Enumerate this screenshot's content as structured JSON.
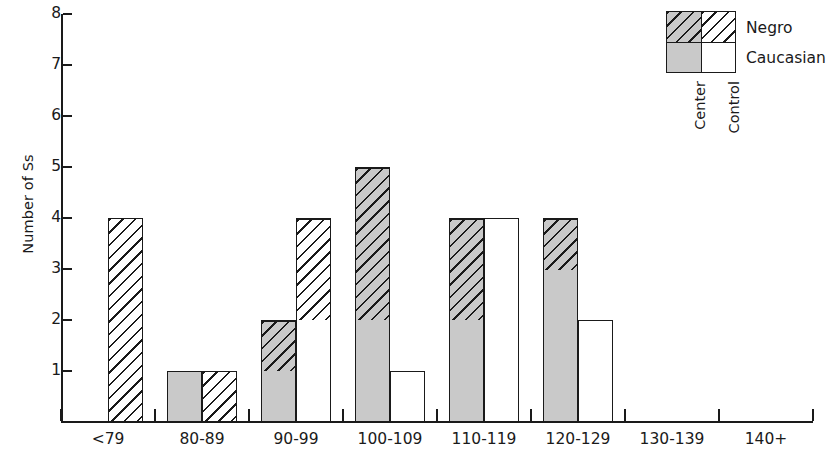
{
  "chart_data": {
    "type": "bar",
    "subtype": "stacked-grouped-histogram",
    "title": "",
    "xlabel": "",
    "ylabel": "Number of Ss",
    "ylim": [
      0,
      8
    ],
    "yticks": [
      1,
      2,
      3,
      4,
      5,
      6,
      7,
      8
    ],
    "grid": false,
    "categories": [
      "<79",
      "80-89",
      "90-99",
      "100-109",
      "110-119",
      "120-129",
      "130-139",
      "140+"
    ],
    "groups": [
      "Center",
      "Control"
    ],
    "stack_order": [
      "Caucasian",
      "Negro"
    ],
    "series": [
      {
        "name": "Center / Caucasian",
        "group": "Center",
        "race": "Caucasian",
        "values": [
          0,
          1,
          1,
          2,
          2,
          3,
          0,
          0
        ]
      },
      {
        "name": "Center / Negro",
        "group": "Center",
        "race": "Negro",
        "values": [
          0,
          0,
          1,
          3,
          2,
          1,
          0,
          0
        ]
      },
      {
        "name": "Control / Caucasian",
        "group": "Control",
        "race": "Caucasian",
        "values": [
          0,
          0,
          2,
          1,
          4,
          2,
          0,
          0
        ]
      },
      {
        "name": "Control / Negro",
        "group": "Control",
        "race": "Negro",
        "values": [
          4,
          1,
          2,
          0,
          0,
          0,
          0,
          0
        ]
      }
    ],
    "totals": {
      "Center": [
        0,
        1,
        2,
        5,
        4,
        4,
        0,
        0
      ],
      "Control": [
        4,
        1,
        4,
        1,
        4,
        2,
        0,
        0
      ]
    },
    "legend": {
      "position": "top-right",
      "row_labels": [
        "Negro",
        "Caucasian"
      ],
      "column_labels": [
        "Center",
        "Control"
      ],
      "cells": [
        {
          "row": "Negro",
          "column": "Center",
          "fill": "gray-hatched"
        },
        {
          "row": "Negro",
          "column": "Control",
          "fill": "white-hatched"
        },
        {
          "row": "Caucasian",
          "column": "Center",
          "fill": "gray-solid"
        },
        {
          "row": "Caucasian",
          "column": "Control",
          "fill": "white-solid"
        }
      ]
    },
    "colors": {
      "center_fill": "#c9c9c9",
      "control_fill": "#ffffff",
      "outline": "#1a1a1a",
      "hatch": "#1a1a1a",
      "background": "#ffffff"
    }
  }
}
